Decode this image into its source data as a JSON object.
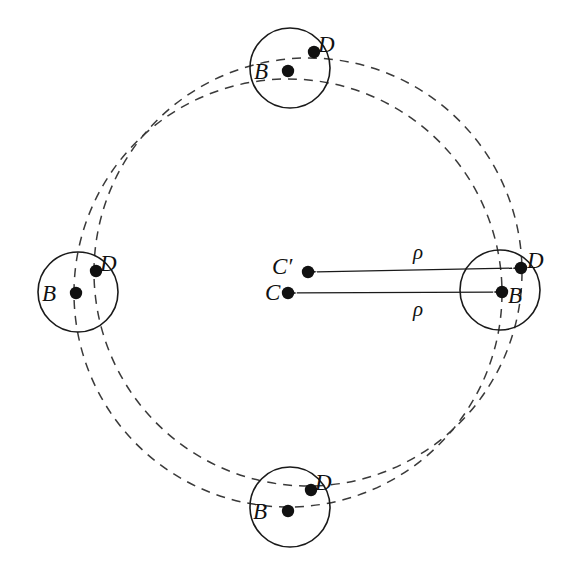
{
  "figure": {
    "type": "geometric-diagram",
    "width": 583,
    "height": 579,
    "background": "#ffffff",
    "stroke_color": "#1a1a1a",
    "dot_color": "#111111"
  },
  "labels": {
    "B": "B",
    "D": "D",
    "C": "C",
    "C_prime": "C′",
    "rho": "ρ"
  },
  "chart_data": {
    "type": "scatter",
    "title": "",
    "xlabel": "",
    "ylabel": "",
    "orbit_circles": [
      {
        "name": "orbit-C",
        "cx": 288,
        "cy": 293,
        "r": 214,
        "dashed": true
      },
      {
        "name": "orbit-C-prime",
        "cx": 308,
        "cy": 272,
        "r": 214,
        "dashed": true
      }
    ],
    "body_circles": [
      {
        "name": "body-top",
        "cx": 290,
        "cy": 68,
        "r": 40
      },
      {
        "name": "body-left",
        "cx": 78,
        "cy": 292,
        "r": 40
      },
      {
        "name": "body-bottom",
        "cx": 290,
        "cy": 507,
        "r": 40
      },
      {
        "name": "body-right",
        "cx": 500,
        "cy": 290,
        "r": 40
      }
    ],
    "points": [
      {
        "label": "B",
        "x": 288,
        "y": 71,
        "group": "body-top"
      },
      {
        "label": "D",
        "x": 314,
        "y": 52,
        "group": "body-top"
      },
      {
        "label": "B",
        "x": 76,
        "y": 293,
        "group": "body-left"
      },
      {
        "label": "D",
        "x": 96,
        "y": 271,
        "group": "body-left"
      },
      {
        "label": "B",
        "x": 288,
        "y": 511,
        "group": "body-bottom"
      },
      {
        "label": "D",
        "x": 311,
        "y": 490,
        "group": "body-bottom"
      },
      {
        "label": "B",
        "x": 502,
        "y": 292,
        "group": "body-right"
      },
      {
        "label": "D",
        "x": 521,
        "y": 268,
        "group": "body-right"
      },
      {
        "label": "C",
        "x": 288,
        "y": 293,
        "group": "centre"
      },
      {
        "label": "C′",
        "x": 308,
        "y": 272,
        "group": "centre"
      }
    ],
    "arrows": [
      {
        "name": "rho-upper",
        "from_x": 308,
        "from_y": 272,
        "to_x": 521,
        "to_y": 268,
        "label": "ρ",
        "double_headed": true
      },
      {
        "name": "rho-lower",
        "from_x": 288,
        "from_y": 293,
        "to_x": 502,
        "to_y": 292,
        "label": "ρ",
        "double_headed": true
      }
    ]
  },
  "label_positions": [
    {
      "key": "B",
      "name": "label-b-top",
      "x": 254,
      "y": 60
    },
    {
      "key": "D",
      "name": "label-d-top",
      "x": 318,
      "y": 33
    },
    {
      "key": "B",
      "name": "label-left",
      "x": 42,
      "y": 282
    },
    {
      "key": "D",
      "name": "label-d-left",
      "x": 100,
      "y": 252
    },
    {
      "key": "B",
      "name": "label-b-bottom",
      "x": 253,
      "y": 500
    },
    {
      "key": "D",
      "name": "label-d-bottom",
      "x": 315,
      "y": 471
    },
    {
      "key": "B",
      "name": "label-b-right",
      "x": 508,
      "y": 284
    },
    {
      "key": "D",
      "name": "label-d-right",
      "x": 527,
      "y": 249
    },
    {
      "key": "C_prime",
      "name": "label-c-prime",
      "x": 272,
      "y": 255
    },
    {
      "key": "C",
      "name": "label-c",
      "x": 265,
      "y": 281
    },
    {
      "key": "rho",
      "name": "label-rho-upper",
      "x": 413,
      "y": 242
    },
    {
      "key": "rho",
      "name": "label-rho-lower",
      "x": 413,
      "y": 299
    }
  ]
}
